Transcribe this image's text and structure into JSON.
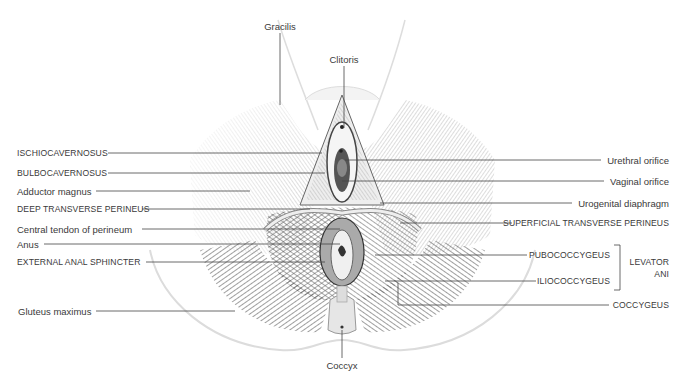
{
  "figure": {
    "colors": {
      "background": "#ffffff",
      "ink": "#333333",
      "muscle_dark": "#2a2a2a",
      "outline": "#d9d9d9"
    }
  },
  "labels": {
    "top": [
      {
        "id": "gracilis",
        "text": "Gracilis"
      },
      {
        "id": "clitoris",
        "text": "Clitoris"
      }
    ],
    "left": [
      {
        "id": "ischiocavernosus",
        "text": "ISCHIOCAVERNOSUS"
      },
      {
        "id": "bulbocavernosus",
        "text": "BULBOCAVERNOSUS"
      },
      {
        "id": "adductor_magnus",
        "text": "Adductor magnus"
      },
      {
        "id": "deep_transverse_perineus",
        "text": "DEEP TRANSVERSE PERINEUS"
      },
      {
        "id": "central_tendon",
        "text": "Central tendon of perineum"
      },
      {
        "id": "anus",
        "text": "Anus"
      },
      {
        "id": "external_anal_sphincter",
        "text": "EXTERNAL ANAL SPHINCTER"
      },
      {
        "id": "gluteus_maximus",
        "text": "Gluteus maximus"
      }
    ],
    "right": [
      {
        "id": "urethral_orifice",
        "text": "Urethral orifice"
      },
      {
        "id": "vaginal_orifice",
        "text": "Vaginal orifice"
      },
      {
        "id": "urogenital_diaphragm",
        "text": "Urogenital diaphragm"
      },
      {
        "id": "superficial_transverse_perineus",
        "text": "SUPERFICIAL TRANSVERSE PERINEUS"
      },
      {
        "id": "pubococcygeus",
        "text": "PUBOCOCCYGEUS"
      },
      {
        "id": "iliococcygeus",
        "text": "ILIOCOCCYGEUS"
      },
      {
        "id": "coccygeus",
        "text": "COCCYGEUS"
      }
    ],
    "group": {
      "id": "levator_ani",
      "line1": "LEVATOR",
      "line2": "ANI"
    },
    "bottom": [
      {
        "id": "coccyx",
        "text": "Coccyx"
      }
    ]
  }
}
